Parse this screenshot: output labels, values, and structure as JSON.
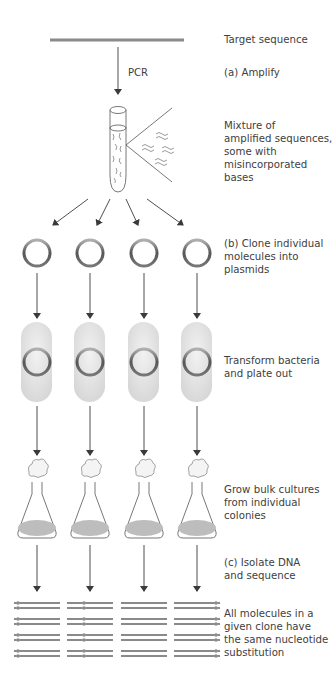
{
  "labels": {
    "target": "Target sequence",
    "pcr": "PCR",
    "amplify": "(a) Amplify",
    "mixture": [
      "Mixture of",
      "amplified sequences,",
      "some with",
      "misincorporated",
      "bases"
    ],
    "clone": [
      "(b) Clone individual",
      "molecules into",
      "plasmids"
    ],
    "transform": [
      "Transform bacteria",
      "and  plate out"
    ],
    "grow": [
      "Grow bulk cultures",
      "from individual",
      "colonies"
    ],
    "isolate": [
      "(c) Isolate DNA",
      "and sequence"
    ],
    "result": [
      "All molecules in a",
      "given clone have",
      "the same nucleotide",
      "substitution"
    ]
  },
  "colors": {
    "line": "#8a8a8a",
    "arrow": "#3a3a3a",
    "plasmid_ring": "#6e6e6e",
    "bacterium_fill": "#e6e6e6",
    "culture_fill": "#bdbdbd",
    "text": "#404040"
  },
  "columns_x": [
    37,
    90,
    144,
    197
  ],
  "stages": [
    "target",
    "amplify",
    "mixture",
    "clone",
    "transform",
    "grow",
    "isolate",
    "sequence"
  ]
}
